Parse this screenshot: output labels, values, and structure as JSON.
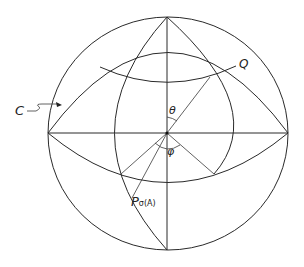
{
  "diagram": {
    "type": "spherical-coordinate-sphere",
    "labels": {
      "curve_c": "C",
      "point_q": "Q",
      "angle_theta": "θ",
      "angle_phi": "φ",
      "point_p_main": "P",
      "point_p_sub": "σ(A)"
    },
    "colors": {
      "line": "#2a2a2a",
      "background": "#ffffff"
    }
  }
}
